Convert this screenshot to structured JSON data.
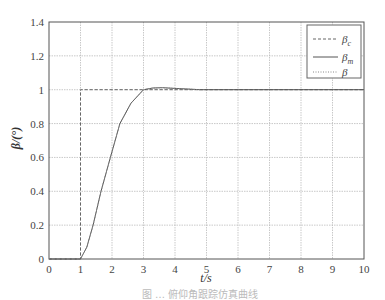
{
  "chart_data": {
    "type": "line",
    "title": "",
    "xlabel": "t/s",
    "ylabel": "β/(°)",
    "xlim": [
      0,
      10
    ],
    "ylim": [
      0,
      1.4
    ],
    "x_ticks": [
      "0",
      "1",
      "2",
      "3",
      "4",
      "5",
      "6",
      "7",
      "8",
      "9",
      "10"
    ],
    "y_ticks": [
      "0",
      "0.2",
      "0.4",
      "0.6",
      "0.8",
      "1",
      "1.2",
      "1.4"
    ],
    "grid": true,
    "legend_position": "upper right",
    "legend": [
      "β_c",
      "β_m",
      "β"
    ],
    "series": [
      {
        "name": "β_c",
        "style": "dashed",
        "x": [
          0,
          1,
          1,
          10
        ],
        "y": [
          0,
          0,
          1,
          1
        ]
      },
      {
        "name": "β_m",
        "style": "solid",
        "x": [
          0,
          1,
          1.2,
          1.4,
          1.65,
          1.95,
          2.25,
          2.6,
          3.0,
          3.3,
          3.6,
          4.0,
          4.5,
          4.8,
          10
        ],
        "y": [
          0,
          0,
          0.07,
          0.2,
          0.4,
          0.6,
          0.8,
          0.92,
          1.0,
          1.01,
          1.012,
          1.008,
          1.003,
          1.0,
          1.0
        ]
      },
      {
        "name": "β",
        "style": "dotted",
        "x": [
          0,
          1,
          1.2,
          1.4,
          1.65,
          1.95,
          2.25,
          2.6,
          3.0,
          3.3,
          3.6,
          4.0,
          4.5,
          4.8
        ],
        "y": [
          0,
          0,
          0.07,
          0.2,
          0.4,
          0.6,
          0.8,
          0.92,
          1.0,
          1.01,
          1.012,
          1.008,
          1.003,
          1.0
        ]
      }
    ]
  },
  "caption": "图 … 俯仰角跟踪仿真曲线"
}
